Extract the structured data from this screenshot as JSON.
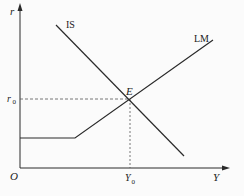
{
  "diagram": {
    "type": "IS-LM",
    "axes": {
      "y_label": "r",
      "x_label": "Y",
      "origin_label": "O"
    },
    "curves": [
      {
        "name": "IS",
        "label": "IS"
      },
      {
        "name": "LM",
        "label": "LM"
      }
    ],
    "equilibrium": {
      "point_label": "E",
      "r_label": "r",
      "r_subscript": "0",
      "y_label": "Y",
      "y_subscript": "0"
    },
    "colors": {
      "line": "#2a2a2a",
      "dashed": "#555555",
      "background": "#fbfbfb"
    }
  }
}
